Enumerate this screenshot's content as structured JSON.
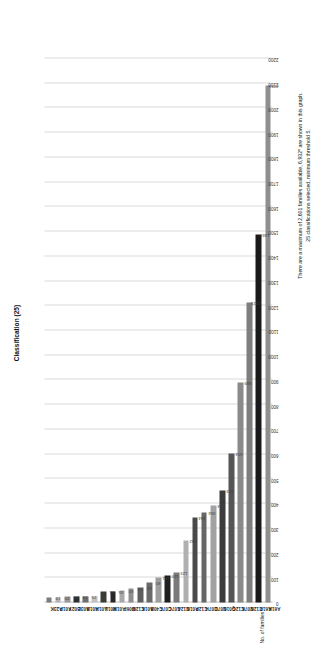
{
  "chart_data": {
    "type": "bar",
    "orientation": "horizontal",
    "title": "Classification (25)",
    "xlabel": "No. of families",
    "ylabel": "",
    "categories": [
      "A23K",
      "A01P",
      "B02Y",
      "A03L",
      "A01B",
      "A01H",
      "A01L",
      "A01M",
      "G06F",
      "C12M",
      "A01K",
      "C40B",
      "C07F",
      "C07C",
      "C12A",
      "A01N",
      "C12P",
      "C07H",
      "C07D",
      "G01N",
      "C12Q",
      "C07K",
      "C12N",
      "A61P",
      "A61K"
    ],
    "values": [
      19,
      20,
      23,
      24,
      25,
      26,
      44,
      45,
      50,
      55,
      62,
      80,
      101,
      110,
      123,
      252,
      344,
      364,
      394,
      453,
      604,
      889,
      1215,
      1487,
      2091
    ],
    "value_labels": [
      "19",
      "20",
      "23",
      "24",
      "25",
      "26",
      "44",
      "45",
      "50",
      "55",
      "62",
      "80",
      "101",
      "110",
      "123",
      "252",
      "344",
      "364",
      "394",
      "453",
      "604",
      "889",
      "1215",
      "1487",
      "2091"
    ],
    "xticks": [
      0,
      100,
      200,
      300,
      400,
      500,
      600,
      700,
      800,
      900,
      1000,
      1100,
      1200,
      1300,
      1400,
      1500,
      1600,
      1700,
      1800,
      1900,
      2000,
      2100,
      2200
    ],
    "xtick_labels": [
      "0",
      "100",
      "200",
      "300",
      "400",
      "500",
      "600",
      "700",
      "800",
      "900",
      "1000",
      "1100",
      "1200",
      "1300",
      "1400",
      "1500",
      "1600",
      "1700",
      "1800",
      "1900",
      "2000",
      "2100",
      "2200"
    ],
    "xlim": [
      0,
      2200
    ],
    "grid": true,
    "legend": false,
    "bar_colors": [
      "#7c7c7c",
      "#b4b4b4",
      "#9a9a9a",
      "#2e2e2e",
      "#6f6f6f",
      "#c2c2c2",
      "#3a3a3a",
      "#272727",
      "#a8a8a8",
      "#8e8e8e",
      "#5e5e5e",
      "#6a6a6a",
      "#9e9e9e",
      "#1f1f1f",
      "#7a7a7a",
      "#b0b0b0",
      "#4a4a4a",
      "#666666",
      "#a2a2a2",
      "#3c3c3c",
      "#555555",
      "#8a8a8a",
      "#7e7e7e",
      "#1a1a1a",
      "#8f8f8f"
    ]
  },
  "annotation": {
    "line1": "There are a maximum of 2,601 families available, 6,932* are shown in this graph.",
    "line2": "25 classifications selected, minimum threshold 5."
  }
}
